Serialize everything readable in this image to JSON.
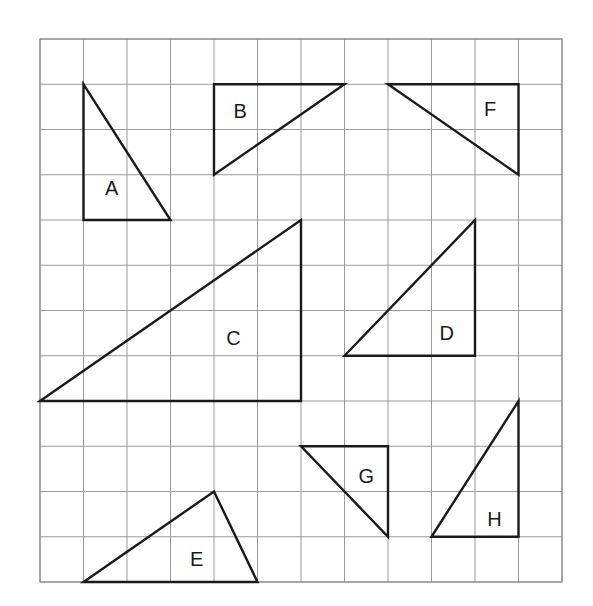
{
  "grid": {
    "columns": 12,
    "rows": 12,
    "origin_px": [
      40,
      39
    ],
    "cell_w_px": 43.5,
    "cell_h_px": 45.25,
    "line_color": "#9a9a9a"
  },
  "triangles": [
    {
      "label": "A",
      "vertices": [
        [
          1,
          1
        ],
        [
          1,
          4
        ],
        [
          3,
          4
        ]
      ],
      "label_pos": [
        1.65,
        3.3
      ]
    },
    {
      "label": "B",
      "vertices": [
        [
          4,
          1
        ],
        [
          7,
          1
        ],
        [
          4,
          3
        ]
      ],
      "label_pos": [
        4.6,
        1.6
      ]
    },
    {
      "label": "F",
      "vertices": [
        [
          8,
          1
        ],
        [
          11,
          1
        ],
        [
          11,
          3
        ]
      ],
      "label_pos": [
        10.35,
        1.55
      ]
    },
    {
      "label": "C",
      "vertices": [
        [
          0,
          8
        ],
        [
          6,
          4
        ],
        [
          6,
          8
        ]
      ],
      "label_pos": [
        4.45,
        6.6
      ]
    },
    {
      "label": "D",
      "vertices": [
        [
          7,
          7
        ],
        [
          10,
          4
        ],
        [
          10,
          7
        ]
      ],
      "label_pos": [
        9.35,
        6.5
      ]
    },
    {
      "label": "G",
      "vertices": [
        [
          6,
          9
        ],
        [
          8,
          9
        ],
        [
          8,
          11
        ]
      ],
      "label_pos": [
        7.5,
        9.65
      ]
    },
    {
      "label": "H",
      "vertices": [
        [
          9,
          11
        ],
        [
          11,
          8
        ],
        [
          11,
          11
        ]
      ],
      "label_pos": [
        10.45,
        10.6
      ]
    },
    {
      "label": "E",
      "vertices": [
        [
          1,
          12
        ],
        [
          4,
          10
        ],
        [
          5,
          12
        ]
      ],
      "label_pos": [
        3.6,
        11.5
      ]
    }
  ],
  "colors": {
    "stroke": "#1a1a1a",
    "background": "#ffffff"
  }
}
